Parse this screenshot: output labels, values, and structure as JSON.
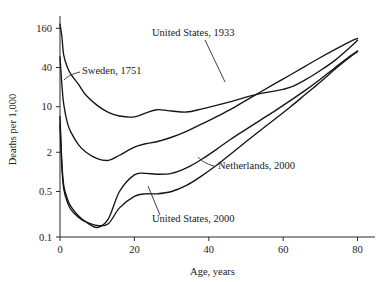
{
  "chart_data": {
    "type": "line",
    "title": "",
    "xlabel": "Age, years",
    "ylabel": "Deaths per 1,000",
    "yscale": "log",
    "xlim": [
      0,
      82
    ],
    "ylim": [
      0.1,
      200
    ],
    "grid": false,
    "legend_position": "inline-annotations",
    "xticks": [
      {
        "value": 0,
        "label": "0"
      },
      {
        "value": 20,
        "label": "20"
      },
      {
        "value": 40,
        "label": "40"
      },
      {
        "value": 60,
        "label": "60"
      },
      {
        "value": 80,
        "label": "80"
      }
    ],
    "yticks": [
      {
        "value": 160,
        "label": "160"
      },
      {
        "value": 40,
        "label": "40"
      },
      {
        "value": 10,
        "label": "10"
      },
      {
        "value": 2,
        "label": "2"
      },
      {
        "value": 0.5,
        "label": "0.5"
      },
      {
        "value": 0.1,
        "label": "0.1"
      }
    ],
    "series": [
      {
        "name": "Sweden, 1751",
        "label": "Sweden, 1751",
        "label_x": 82,
        "label_y": 74,
        "x": [
          0,
          0.5,
          1,
          2,
          3,
          5,
          7,
          10,
          13,
          16,
          20,
          23,
          26,
          30,
          34,
          38,
          42,
          46,
          50,
          54,
          58,
          62,
          66,
          70,
          74,
          78,
          80
        ],
        "y": [
          185,
          120,
          62,
          40,
          31,
          22,
          15,
          10.5,
          8.2,
          7.2,
          7.0,
          8.0,
          9.0,
          8.6,
          8.3,
          9.2,
          10.5,
          12.0,
          14.0,
          16.0,
          17.5,
          20.0,
          26.0,
          36.0,
          52.0,
          82.0,
          105.0
        ]
      },
      {
        "name": "United States, 1933",
        "label": "United States, 1933",
        "label_x": 152,
        "label_y": 36,
        "x": [
          0,
          0.5,
          1,
          2,
          3,
          5,
          7,
          10,
          13,
          16,
          20,
          23,
          26,
          30,
          34,
          38,
          42,
          46,
          50,
          54,
          58,
          62,
          66,
          70,
          74,
          78,
          80
        ],
        "y": [
          58,
          22,
          11,
          5.6,
          4.0,
          2.6,
          2.0,
          1.6,
          1.5,
          1.8,
          2.4,
          2.7,
          2.9,
          3.4,
          4.2,
          5.4,
          7.0,
          9.2,
          12.5,
          17.0,
          23.0,
          31.0,
          42.0,
          57.0,
          76.0,
          100.0,
          112.0
        ]
      },
      {
        "name": "Netherlands, 2000",
        "label": "Netherlands, 2000",
        "label_x": 218,
        "label_y": 169,
        "x": [
          0,
          0.5,
          1,
          2,
          3,
          5,
          7,
          10,
          13,
          16,
          20,
          23,
          26,
          30,
          34,
          38,
          42,
          46,
          50,
          54,
          58,
          62,
          66,
          70,
          74,
          78,
          80
        ],
        "y": [
          5.4,
          1.2,
          0.55,
          0.34,
          0.26,
          0.2,
          0.17,
          0.15,
          0.16,
          0.28,
          0.42,
          0.46,
          0.46,
          0.5,
          0.62,
          0.86,
          1.25,
          1.9,
          2.9,
          4.4,
          6.6,
          10.0,
          15.5,
          24.0,
          38.0,
          58.0,
          70.0
        ]
      },
      {
        "name": "United States, 2000",
        "label": "United States, 2000",
        "label_x": 152,
        "label_y": 222,
        "x": [
          0,
          0.5,
          1,
          2,
          3,
          5,
          7,
          10,
          13,
          16,
          20,
          23,
          26,
          30,
          34,
          38,
          42,
          46,
          50,
          54,
          58,
          62,
          66,
          70,
          74,
          78,
          80
        ],
        "y": [
          7.1,
          1.4,
          0.62,
          0.38,
          0.29,
          0.21,
          0.17,
          0.14,
          0.19,
          0.5,
          0.9,
          0.95,
          0.92,
          0.95,
          1.15,
          1.55,
          2.2,
          3.2,
          4.5,
          6.3,
          8.8,
          12.5,
          18.0,
          26.5,
          40.0,
          60.0,
          72.0
        ]
      }
    ]
  }
}
